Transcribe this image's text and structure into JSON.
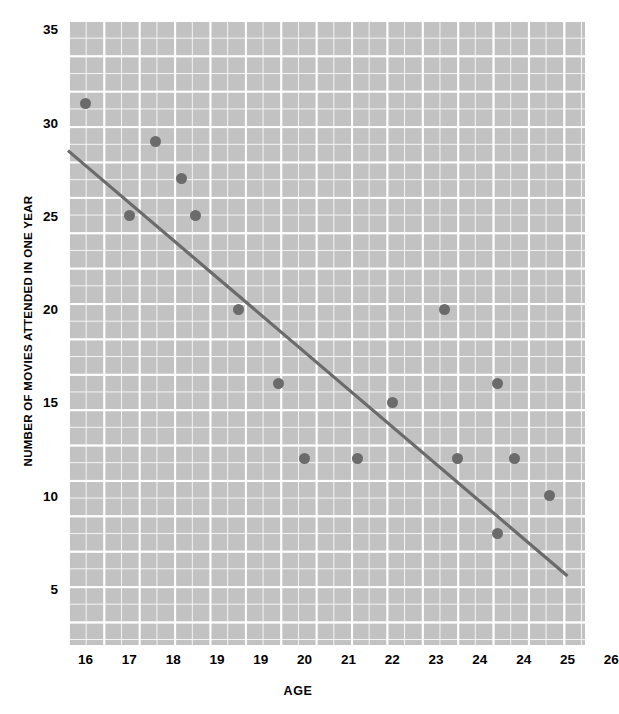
{
  "chart_data": {
    "type": "scatter",
    "title": "",
    "xlabel": "AGE",
    "ylabel": "NUMBER OF MOVIES ATTENDED IN ONE YEAR",
    "xlim": [
      15.6,
      27.4
    ],
    "ylim": [
      2.0,
      35.5
    ],
    "grid": true,
    "legend": null,
    "y_ticks": [
      35,
      30,
      25,
      20,
      15,
      10,
      5
    ],
    "x_tick_labels": [
      "16",
      "17",
      "18",
      "19",
      "19",
      "20",
      "21",
      "22",
      "23",
      "24",
      "24",
      "25",
      "26"
    ],
    "x_tick_positions": [
      16.0,
      17.0,
      18.0,
      19.0,
      20.0,
      21.0,
      22.0,
      23.0,
      24.0,
      25.0,
      26.0,
      27.0,
      28.0
    ],
    "points": [
      {
        "x": 16.0,
        "y": 31,
        "label": "16, 31"
      },
      {
        "x": 17.0,
        "y": 25,
        "label": "17, 25"
      },
      {
        "x": 17.6,
        "y": 29,
        "label": "17.6, 29"
      },
      {
        "x": 18.2,
        "y": 27,
        "label": "18.2, 27"
      },
      {
        "x": 18.5,
        "y": 25,
        "label": "18.5, 25"
      },
      {
        "x": 19.5,
        "y": 20,
        "label": "19.5, 20"
      },
      {
        "x": 20.4,
        "y": 16,
        "label": "20.4, 16"
      },
      {
        "x": 21.0,
        "y": 12,
        "label": "21.0, 12"
      },
      {
        "x": 22.2,
        "y": 12,
        "label": "22.2, 12"
      },
      {
        "x": 23.0,
        "y": 15,
        "label": "23.0, 15"
      },
      {
        "x": 24.2,
        "y": 20,
        "label": "24.2, 20"
      },
      {
        "x": 24.5,
        "y": 12,
        "label": "24.5, 12"
      },
      {
        "x": 25.4,
        "y": 16,
        "label": "25.4, 16"
      },
      {
        "x": 25.8,
        "y": 12,
        "label": "25.8, 12"
      },
      {
        "x": 25.4,
        "y": 8,
        "label": "25.4, 8"
      },
      {
        "x": 26.6,
        "y": 10,
        "label": "26.6, 10"
      }
    ],
    "trend_line": {
      "type": "linear-fit",
      "x_start": 15.6,
      "y_start": 28.5,
      "x_end": 27.0,
      "y_end": 5.7
    },
    "colors": {
      "point": "#6b6b6b",
      "line": "#6b6b6b",
      "plot_background": "#c2c2c2",
      "gridline": "#ffffff",
      "text": "#000000",
      "page_background": "#ffffff"
    }
  }
}
